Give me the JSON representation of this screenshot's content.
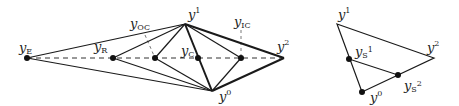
{
  "diagrams": [
    {
      "id": "left",
      "description": "Simplex reflection/expansion/contraction points on line through y2",
      "points": {
        "yE": {
          "x": 27,
          "y": 58,
          "label": "y",
          "sub": "E"
        },
        "yR": {
          "x": 113,
          "y": 58,
          "label": "y",
          "sub": "R"
        },
        "yOC": {
          "x": 155,
          "y": 58,
          "label": "y",
          "sub": "OC"
        },
        "yC": {
          "x": 198,
          "y": 58,
          "label": "y",
          "sub": "C"
        },
        "yIC": {
          "x": 241,
          "y": 58,
          "label": "y",
          "sub": "IC"
        },
        "y2": {
          "x": 284,
          "y": 58,
          "label": "y",
          "sup": "2"
        },
        "y1": {
          "x": 185,
          "y": 24,
          "label": "y",
          "sup": "1"
        },
        "y0": {
          "x": 212,
          "y": 91,
          "label": "y",
          "sup": "0"
        }
      },
      "labels": {
        "yE": "y",
        "yE_sub": "E",
        "yR": "y",
        "yR_sub": "R",
        "yOC": "y",
        "yOC_sub": "OC",
        "yC": "y",
        "yC_sub": "C",
        "yIC": "y",
        "yIC_sub": "IC",
        "y1": "y",
        "y1_sup": "1",
        "y2": "y",
        "y2_sup": "2",
        "y0": "y",
        "y0_sup": "0"
      }
    },
    {
      "id": "right",
      "description": "Shrink step of simplex",
      "labels": {
        "y1": "y",
        "y1_sup": "1",
        "y2": "y",
        "y2_sup": "2",
        "y0": "y",
        "y0_sup": "0",
        "yS1": "y",
        "yS1_sub": "S",
        "yS1_sup": "1",
        "yS2": "y",
        "yS2_sub": "S",
        "yS2_sup": "2"
      }
    }
  ],
  "colors": {
    "line": "#1a1a1a",
    "dash": "#333333",
    "point": "#111111"
  }
}
